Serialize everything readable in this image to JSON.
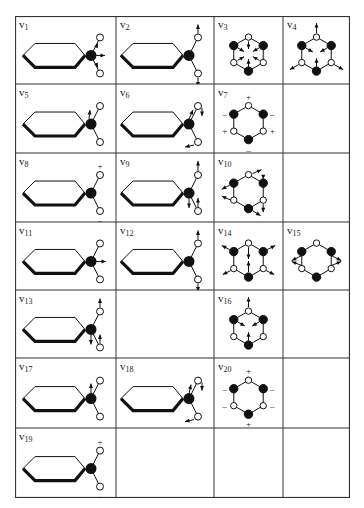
{
  "figure": {
    "grid": {
      "left": 15,
      "top": 16,
      "right": 350,
      "bottom": 498,
      "col_edges": [
        15,
        116,
        214,
        283,
        350
      ],
      "row_edges": [
        16,
        84,
        153,
        222,
        290,
        358,
        428,
        498
      ],
      "line_color": "#333333"
    },
    "cells": [
      {
        "row": 0,
        "col": 0,
        "mode": "v",
        "sub": "1",
        "kind": "side",
        "variant": "v1"
      },
      {
        "row": 0,
        "col": 1,
        "mode": "v",
        "sub": "2",
        "kind": "side",
        "variant": "v2"
      },
      {
        "row": 0,
        "col": 2,
        "mode": "v",
        "sub": "3",
        "kind": "ring",
        "variant": "v3"
      },
      {
        "row": 0,
        "col": 3,
        "mode": "v",
        "sub": "4",
        "kind": "ring",
        "variant": "v4"
      },
      {
        "row": 1,
        "col": 0,
        "mode": "v",
        "sub": "5",
        "kind": "side",
        "variant": "v5"
      },
      {
        "row": 1,
        "col": 1,
        "mode": "v",
        "sub": "6",
        "kind": "side",
        "variant": "v6"
      },
      {
        "row": 1,
        "col": 2,
        "mode": "v",
        "sub": "7",
        "kind": "ring",
        "variant": "v7"
      },
      {
        "row": 2,
        "col": 0,
        "mode": "v",
        "sub": "8",
        "kind": "side",
        "variant": "v8"
      },
      {
        "row": 2,
        "col": 1,
        "mode": "v",
        "sub": "9",
        "kind": "side",
        "variant": "v9"
      },
      {
        "row": 2,
        "col": 2,
        "mode": "v",
        "sub": "10",
        "kind": "ring",
        "variant": "v10"
      },
      {
        "row": 3,
        "col": 0,
        "mode": "v",
        "sub": "11",
        "kind": "side",
        "variant": "v11"
      },
      {
        "row": 3,
        "col": 1,
        "mode": "v",
        "sub": "12",
        "kind": "side",
        "variant": "v12"
      },
      {
        "row": 3,
        "col": 2,
        "mode": "v",
        "sub": "14",
        "kind": "ring",
        "variant": "v14"
      },
      {
        "row": 3,
        "col": 3,
        "mode": "v",
        "sub": "15",
        "kind": "ring",
        "variant": "v15"
      },
      {
        "row": 4,
        "col": 0,
        "mode": "v",
        "sub": "13",
        "kind": "side",
        "variant": "v13"
      },
      {
        "row": 4,
        "col": 2,
        "mode": "v",
        "sub": "16",
        "kind": "ring",
        "variant": "v16"
      },
      {
        "row": 5,
        "col": 0,
        "mode": "v",
        "sub": "17",
        "kind": "side",
        "variant": "v17"
      },
      {
        "row": 5,
        "col": 1,
        "mode": "v",
        "sub": "18",
        "kind": "side",
        "variant": "v18"
      },
      {
        "row": 5,
        "col": 2,
        "mode": "v",
        "sub": "20",
        "kind": "ring",
        "variant": "v20"
      },
      {
        "row": 6,
        "col": 0,
        "mode": "v",
        "sub": "19",
        "kind": "side",
        "variant": "v19"
      }
    ],
    "symbols": {
      "plus": "+",
      "minus": "–"
    }
  }
}
